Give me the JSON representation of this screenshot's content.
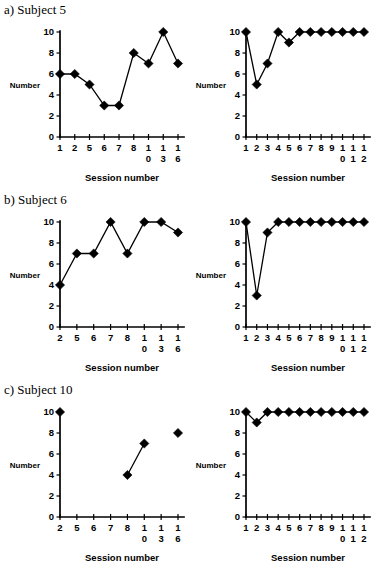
{
  "figure": {
    "panels": [
      {
        "id": "panel-a",
        "heading": "a) Subject 5",
        "charts": [
          {
            "id": "a-left",
            "chart_data": {
              "type": "line",
              "title": "",
              "xlabel": "Session number",
              "ylabel": "Number",
              "categories": [
                "1",
                "2",
                "5",
                "6",
                "7",
                "8",
                "10",
                "13",
                "16"
              ],
              "x": [
                1,
                2,
                5,
                6,
                7,
                8,
                10,
                13,
                16
              ],
              "values": [
                6,
                6,
                5,
                3,
                3,
                8,
                7,
                10,
                7
              ],
              "yticks": [
                0,
                2,
                4,
                6,
                8,
                10
              ],
              "ylim": [
                0,
                10
              ],
              "grid": false,
              "legend": "none",
              "marker": "diamond"
            }
          },
          {
            "id": "a-right",
            "chart_data": {
              "type": "line",
              "title": "",
              "xlabel": "Session number",
              "ylabel": "Number",
              "categories": [
                "1",
                "2",
                "3",
                "4",
                "5",
                "6",
                "7",
                "8",
                "9",
                "10",
                "11",
                "12"
              ],
              "x": [
                1,
                2,
                3,
                4,
                5,
                6,
                7,
                8,
                9,
                10,
                11,
                12
              ],
              "values": [
                10,
                5,
                7,
                10,
                9,
                10,
                10,
                10,
                10,
                10,
                10,
                10
              ],
              "yticks": [
                0,
                2,
                4,
                6,
                8,
                10
              ],
              "ylim": [
                0,
                10
              ],
              "grid": false,
              "legend": "none",
              "marker": "diamond"
            }
          }
        ]
      },
      {
        "id": "panel-b",
        "heading": "b) Subject 6",
        "charts": [
          {
            "id": "b-left",
            "chart_data": {
              "type": "line",
              "title": "",
              "xlabel": "Session number",
              "ylabel": "Number",
              "categories": [
                "2",
                "5",
                "6",
                "7",
                "8",
                "10",
                "13",
                "16"
              ],
              "x": [
                2,
                5,
                6,
                7,
                8,
                10,
                13,
                16
              ],
              "values": [
                4,
                7,
                7,
                10,
                7,
                10,
                10,
                9
              ],
              "yticks": [
                0,
                2,
                4,
                6,
                8,
                10
              ],
              "ylim": [
                0,
                10
              ],
              "grid": false,
              "legend": "none",
              "marker": "diamond"
            }
          },
          {
            "id": "b-right",
            "chart_data": {
              "type": "line",
              "title": "",
              "xlabel": "Session number",
              "ylabel": "Number",
              "categories": [
                "1",
                "2",
                "3",
                "4",
                "5",
                "6",
                "7",
                "8",
                "9",
                "10",
                "11",
                "12"
              ],
              "x": [
                1,
                2,
                3,
                4,
                5,
                6,
                7,
                8,
                9,
                10,
                11,
                12
              ],
              "values": [
                10,
                3,
                9,
                10,
                10,
                10,
                10,
                10,
                10,
                10,
                10,
                10
              ],
              "yticks": [
                0,
                2,
                4,
                6,
                8,
                10
              ],
              "ylim": [
                0,
                10
              ],
              "grid": false,
              "legend": "none",
              "marker": "diamond"
            }
          }
        ]
      },
      {
        "id": "panel-c",
        "heading": "c) Subject 10",
        "charts": [
          {
            "id": "c-left",
            "chart_data": {
              "type": "line",
              "title": "",
              "xlabel": "Session number",
              "ylabel": "Number",
              "categories": [
                "2",
                "5",
                "6",
                "7",
                "8",
                "10",
                "13",
                "16"
              ],
              "x": [
                2,
                5,
                6,
                7,
                8,
                10,
                13,
                16
              ],
              "values": [
                10,
                null,
                null,
                null,
                4,
                7,
                null,
                8
              ],
              "yticks": [
                0,
                2,
                4,
                6,
                8,
                10
              ],
              "ylim": [
                0,
                10
              ],
              "grid": false,
              "legend": "none",
              "marker": "diamond"
            }
          },
          {
            "id": "c-right",
            "chart_data": {
              "type": "line",
              "title": "",
              "xlabel": "Session number",
              "ylabel": "Number",
              "categories": [
                "1",
                "2",
                "3",
                "4",
                "5",
                "6",
                "7",
                "8",
                "9",
                "10",
                "11",
                "12"
              ],
              "x": [
                1,
                2,
                3,
                4,
                5,
                6,
                7,
                8,
                9,
                10,
                11,
                12
              ],
              "values": [
                10,
                9,
                10,
                10,
                10,
                10,
                10,
                10,
                10,
                10,
                10,
                10
              ],
              "yticks": [
                0,
                2,
                4,
                6,
                8,
                10
              ],
              "ylim": [
                0,
                10
              ],
              "grid": false,
              "legend": "none",
              "marker": "diamond"
            }
          }
        ]
      }
    ]
  }
}
